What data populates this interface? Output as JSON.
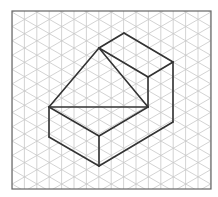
{
  "figure": {
    "type": "isometric-drawing",
    "frame": {
      "x": 12,
      "y": 11,
      "width": 199,
      "height": 178
    },
    "grid": {
      "spacing_x": 12.4,
      "origin_x": 12,
      "origin_y": 11,
      "color": "#c8c8c8",
      "line_width": 0.8
    },
    "object": {
      "stroke": "#333333",
      "stroke_width": 1.6,
      "vertices": {
        "A": [
          99,
          48
        ],
        "B": [
          124,
          33
        ],
        "C": [
          173,
          62
        ],
        "D": [
          148,
          77
        ],
        "E": [
          148,
          107
        ],
        "F": [
          49,
          107
        ],
        "G": [
          99,
          136
        ],
        "H": [
          49,
          137
        ],
        "I": [
          99,
          166
        ],
        "J": [
          173,
          122
        ]
      },
      "edges": [
        [
          "A",
          "B"
        ],
        [
          "B",
          "C"
        ],
        [
          "C",
          "D"
        ],
        [
          "D",
          "A"
        ],
        [
          "A",
          "F"
        ],
        [
          "A",
          "E"
        ],
        [
          "D",
          "E"
        ],
        [
          "F",
          "E"
        ],
        [
          "F",
          "G"
        ],
        [
          "G",
          "E"
        ],
        [
          "F",
          "H"
        ],
        [
          "H",
          "I"
        ],
        [
          "G",
          "I"
        ],
        [
          "I",
          "J"
        ],
        [
          "C",
          "J"
        ]
      ]
    },
    "frame_color": "#666666"
  }
}
